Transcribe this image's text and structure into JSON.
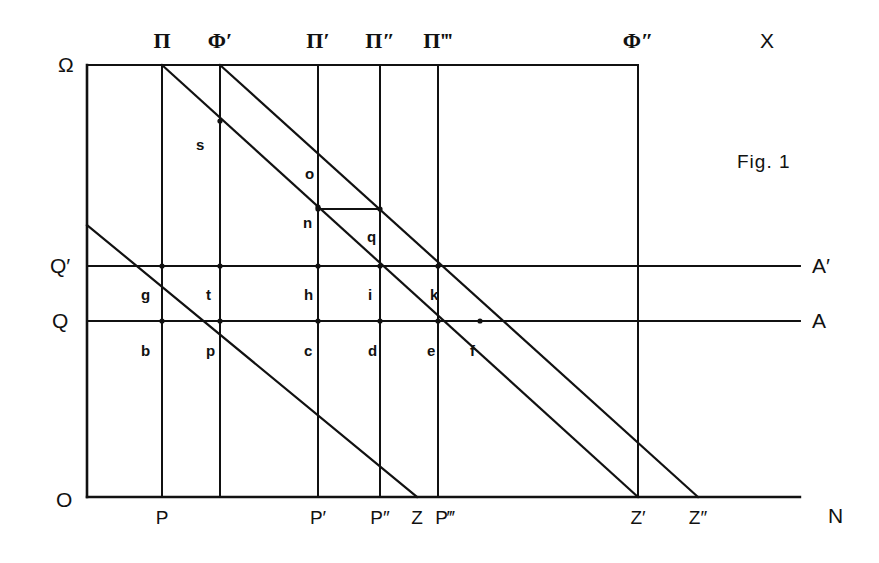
{
  "figure": {
    "caption": "Fig. 1",
    "axis_labels": {
      "origin": "O",
      "top_left": "Ω",
      "top_right": "X",
      "bottom_right": "N",
      "level_A": "A",
      "level_A_prime": "A′",
      "level_Q": "Q",
      "level_Q_prime": "Q′"
    },
    "top_labels": [
      {
        "text": "Π",
        "x": 162
      },
      {
        "text": "Φ′",
        "x": 220
      },
      {
        "text": "Π′",
        "x": 318
      },
      {
        "text": "Π″",
        "x": 380
      },
      {
        "text": "Π‴",
        "x": 438
      },
      {
        "text": "Φ″",
        "x": 638
      }
    ],
    "bottom_labels": [
      {
        "text": "P",
        "x": 162
      },
      {
        "text": "P′",
        "x": 318
      },
      {
        "text": "P″",
        "x": 380
      },
      {
        "text": "Z",
        "x": 417
      },
      {
        "text": "P‴",
        "x": 445
      },
      {
        "text": "Z′",
        "x": 638
      },
      {
        "text": "Z″",
        "x": 698
      }
    ],
    "point_labels": [
      {
        "text": "s",
        "x": 196,
        "y": 137
      },
      {
        "text": "o",
        "x": 305,
        "y": 166
      },
      {
        "text": "n",
        "x": 303,
        "y": 215
      },
      {
        "text": "q",
        "x": 367,
        "y": 229
      },
      {
        "text": "g",
        "x": 141,
        "y": 287
      },
      {
        "text": "t",
        "x": 206,
        "y": 287
      },
      {
        "text": "h",
        "x": 304,
        "y": 287
      },
      {
        "text": "i",
        "x": 368,
        "y": 287
      },
      {
        "text": "k",
        "x": 430,
        "y": 287
      },
      {
        "text": "b",
        "x": 141,
        "y": 343
      },
      {
        "text": "p",
        "x": 206,
        "y": 343
      },
      {
        "text": "c",
        "x": 304,
        "y": 343
      },
      {
        "text": "d",
        "x": 368,
        "y": 343
      },
      {
        "text": "e",
        "x": 427,
        "y": 343
      },
      {
        "text": "f",
        "x": 470,
        "y": 343
      }
    ]
  },
  "chart_data": {
    "type": "diagram",
    "title": "Fig. 1",
    "xlabel": "N",
    "ylabel": "X",
    "grid": true,
    "frame": {
      "left": 87,
      "right": 638,
      "top": 65,
      "bottom": 497
    },
    "axes": {
      "vertical_axis_x": 87,
      "horizontal_axis_y": 497,
      "horizontal_axis_extent": [
        87,
        800
      ]
    },
    "vertical_lines": [
      {
        "name": "Π",
        "x": 162,
        "y_top": 65,
        "y_bottom": 497
      },
      {
        "name": "Φ′",
        "x": 220,
        "y_top": 65,
        "y_bottom": 497
      },
      {
        "name": "Π′",
        "x": 318,
        "y_top": 65,
        "y_bottom": 497
      },
      {
        "name": "Π″",
        "x": 380,
        "y_top": 65,
        "y_bottom": 497
      },
      {
        "name": "Π‴",
        "x": 438,
        "y_top": 65,
        "y_bottom": 497
      },
      {
        "name": "Φ″",
        "x": 638,
        "y_top": 65,
        "y_bottom": 497
      }
    ],
    "horizontal_lines": [
      {
        "name": "ΩX (top)",
        "y": 65,
        "x_start": 87,
        "x_end": 638
      },
      {
        "name": "Q′A′",
        "y": 266,
        "x_start": 87,
        "x_end": 800
      },
      {
        "name": "QA",
        "y": 321,
        "x_start": 87,
        "x_end": 800
      },
      {
        "name": "ON",
        "y": 497,
        "x_start": 87,
        "x_end": 800
      },
      {
        "name": "n–q connector",
        "y": 209,
        "x_start": 318,
        "x_end": 380
      }
    ],
    "diagonals": [
      {
        "name": "Π–Z′",
        "x1": 162,
        "y1": 65,
        "x2": 638,
        "y2": 497
      },
      {
        "name": "Φ′–Z″",
        "x1": 220,
        "y1": 65,
        "x2": 698,
        "y2": 497
      },
      {
        "name": "left-edge–Z",
        "x1": 87,
        "y1": 225,
        "x2": 417,
        "y2": 497
      }
    ],
    "marked_points": [
      {
        "label": "s",
        "x": 220,
        "y": 121
      },
      {
        "label": "o",
        "x": 318,
        "y": 207
      },
      {
        "label": "n",
        "x": 318,
        "y": 209
      },
      {
        "label": "q",
        "x": 380,
        "y": 209
      },
      {
        "label": "g",
        "x": 162,
        "y": 266
      },
      {
        "label": "t",
        "x": 220,
        "y": 266
      },
      {
        "label": "h",
        "x": 318,
        "y": 266
      },
      {
        "label": "i",
        "x": 380,
        "y": 266
      },
      {
        "label": "k",
        "x": 438,
        "y": 266
      },
      {
        "label": "b",
        "x": 162,
        "y": 321
      },
      {
        "label": "p",
        "x": 220,
        "y": 321
      },
      {
        "label": "c",
        "x": 318,
        "y": 321
      },
      {
        "label": "d",
        "x": 380,
        "y": 321
      },
      {
        "label": "e",
        "x": 438,
        "y": 321
      },
      {
        "label": "f",
        "x": 480,
        "y": 321
      }
    ],
    "colors": {
      "line": "#111111",
      "background": "#ffffff"
    }
  }
}
